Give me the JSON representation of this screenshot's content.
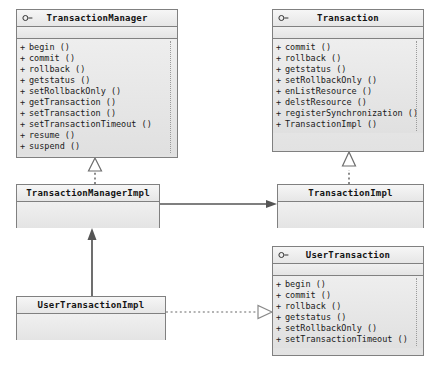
{
  "diagram": {
    "background_color": "#ffffff",
    "box_fill_color": "#e8e8e8",
    "box_border_color": "#808080",
    "connector_color": "#555555"
  },
  "classes": {
    "transaction_manager": {
      "name": "TransactionManager",
      "stereotype_icon": "interface-lollipop-icon",
      "attributes": [],
      "operations": [
        {
          "visibility": "+",
          "label": "begin ()"
        },
        {
          "visibility": "+",
          "label": "commit ()"
        },
        {
          "visibility": "+",
          "label": "rollback ()"
        },
        {
          "visibility": "+",
          "label": "getstatus ()"
        },
        {
          "visibility": "+",
          "label": "setRollbackOnly ()"
        },
        {
          "visibility": "+",
          "label": "getTransaction ()"
        },
        {
          "visibility": "+",
          "label": "setTransaction ()"
        },
        {
          "visibility": "+",
          "label": "setTransactionTimeout ()"
        },
        {
          "visibility": "+",
          "label": "resume ()"
        },
        {
          "visibility": "+",
          "label": "suspend ()"
        }
      ]
    },
    "transaction": {
      "name": "Transaction",
      "stereotype_icon": "interface-lollipop-icon",
      "attributes": [],
      "operations": [
        {
          "visibility": "+",
          "label": "commit ()"
        },
        {
          "visibility": "+",
          "label": "rollback ()"
        },
        {
          "visibility": "+",
          "label": "getstatus ()"
        },
        {
          "visibility": "+",
          "label": "setRollbackOnly ()"
        },
        {
          "visibility": "+",
          "label": "enListResource ()"
        },
        {
          "visibility": "+",
          "label": "delstResource ()"
        },
        {
          "visibility": "+",
          "label": "registerSynchronization ()"
        },
        {
          "visibility": "+",
          "label": "TransactionImpl ()"
        }
      ]
    },
    "user_transaction": {
      "name": "UserTransaction",
      "stereotype_icon": "interface-lollipop-icon",
      "attributes": [],
      "operations": [
        {
          "visibility": "+",
          "label": "begin ()"
        },
        {
          "visibility": "+",
          "label": "commit ()"
        },
        {
          "visibility": "+",
          "label": "rollback ()"
        },
        {
          "visibility": "+",
          "label": "getstatus ()"
        },
        {
          "visibility": "+",
          "label": "setRollbackOnly ()"
        },
        {
          "visibility": "+",
          "label": "setTransactionTimeout ()"
        }
      ]
    },
    "transaction_manager_impl": {
      "name": "TransactionManagerImpl",
      "stereotype_icon": "",
      "attributes": [],
      "operations": []
    },
    "transaction_impl": {
      "name": "TransactionImpl",
      "stereotype_icon": "",
      "attributes": [],
      "operations": []
    },
    "user_transaction_impl": {
      "name": "UserTransactionImpl",
      "stereotype_icon": "",
      "attributes": [],
      "operations": []
    }
  },
  "relations": [
    {
      "id": "tmi-realizes-tm",
      "type": "realization",
      "from": "TransactionManagerImpl",
      "to": "TransactionManager",
      "line": "dotted",
      "arrowhead": "hollow-triangle"
    },
    {
      "id": "ti-realizes-t",
      "type": "realization",
      "from": "TransactionImpl",
      "to": "Transaction",
      "line": "dotted",
      "arrowhead": "hollow-triangle"
    },
    {
      "id": "tmi-assoc-ti",
      "type": "association",
      "from": "TransactionManagerImpl",
      "to": "TransactionImpl",
      "line": "solid",
      "arrowhead": "filled-arrow"
    },
    {
      "id": "uti-assoc-tmi",
      "type": "association",
      "from": "UserTransactionImpl",
      "to": "TransactionManagerImpl",
      "line": "solid",
      "arrowhead": "filled-arrow"
    },
    {
      "id": "uti-realizes-ut",
      "type": "realization",
      "from": "UserTransactionImpl",
      "to": "UserTransaction",
      "line": "dashed",
      "arrowhead": "hollow-triangle"
    }
  ]
}
